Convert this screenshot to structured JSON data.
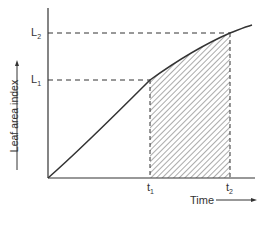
{
  "figure": {
    "y_axis_label": "Leaf area index",
    "x_axis_label": "Time",
    "y_ticks": {
      "l1": "L",
      "l1_sub": "1",
      "l2": "L",
      "l2_sub": "2"
    },
    "x_ticks": {
      "t1": "t",
      "t1_sub": "1",
      "t2": "t",
      "t2_sub": "2"
    },
    "colors": {
      "ink": "#333333",
      "background": "#ffffff"
    }
  }
}
